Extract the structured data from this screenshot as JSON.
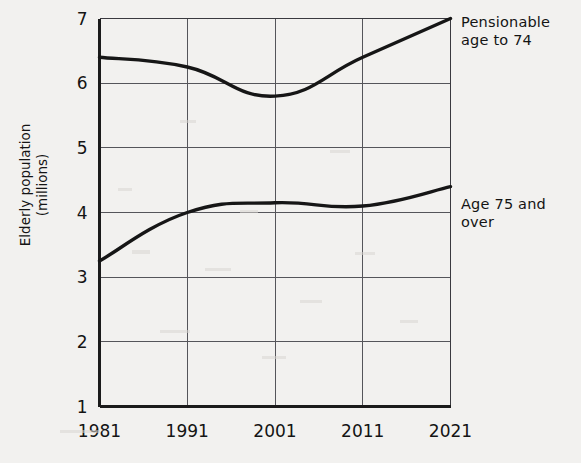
{
  "chart_data": {
    "type": "line",
    "title": "",
    "xlabel": "",
    "ylabel": "Elderly population\n(millions)",
    "x": [
      1981,
      1991,
      2001,
      2011,
      2021
    ],
    "xtick_labels": [
      "1981",
      "1991",
      "2001",
      "2011",
      "2021"
    ],
    "ytick_labels": [
      "1",
      "2",
      "3",
      "4",
      "5",
      "6",
      "7"
    ],
    "ylim": [
      1,
      7
    ],
    "xlim": [
      1981,
      2021
    ],
    "grid": true,
    "legend_position": "right-inline",
    "series": [
      {
        "name": "Pensionable age to 74",
        "label": "Pensionable\nage to 74",
        "values": [
          6.4,
          6.25,
          5.8,
          6.4,
          7.0
        ],
        "color": "#161616"
      },
      {
        "name": "Age 75 and over",
        "label": "Age 75 and\nover",
        "values": [
          3.25,
          4.0,
          4.15,
          4.1,
          4.4
        ],
        "color": "#161616"
      }
    ]
  },
  "axes": {
    "y_title_line1": "Elderly population",
    "y_title_line2": "(millions)",
    "y_ticks": [
      {
        "label": "7",
        "value": 7
      },
      {
        "label": "6",
        "value": 6
      },
      {
        "label": "5",
        "value": 5
      },
      {
        "label": "4",
        "value": 4
      },
      {
        "label": "3",
        "value": 3
      },
      {
        "label": "2",
        "value": 2
      },
      {
        "label": "1",
        "value": 1
      }
    ],
    "x_ticks": [
      {
        "label": "1981",
        "value": 1981
      },
      {
        "label": "1991",
        "value": 1991
      },
      {
        "label": "2001",
        "value": 2001
      },
      {
        "label": "2011",
        "value": 2011
      },
      {
        "label": "2021",
        "value": 2021
      }
    ]
  },
  "labels": {
    "pensionable_line1": "Pensionable",
    "pensionable_line2": "age to 74",
    "age75_line1": "Age 75 and",
    "age75_line2": "over"
  },
  "colors": {
    "background": "#f2f1ef",
    "series_stroke": "#161616",
    "grid": "#55555a",
    "axis": "#1b1b1b",
    "text": "#141414"
  }
}
